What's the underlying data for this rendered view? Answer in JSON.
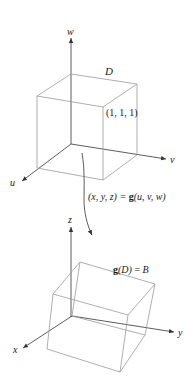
{
  "top_figure": {
    "region_label": "D",
    "axes": {
      "w": "w",
      "v": "v",
      "u": "u"
    },
    "corner_label": "(1, 1, 1)"
  },
  "mapping": {
    "label": "(x, y, z) = g(u, v, w)",
    "lhs": "(x, y, z) = ",
    "func": "g",
    "args": "(u, v, w)"
  },
  "bottom_figure": {
    "image_label_func": "g",
    "image_label_arg": "(D)",
    "image_label_eq": " = ",
    "image_label_result": "B",
    "axes": {
      "z": "z",
      "y": "y",
      "x": "x"
    }
  },
  "colors": {
    "edges": "#9a9a9a",
    "axes": "#333333"
  }
}
